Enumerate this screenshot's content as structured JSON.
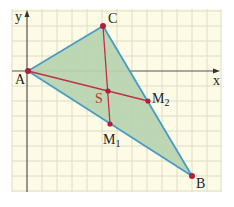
{
  "diagram": {
    "type": "triangle-centroid-on-grid",
    "colors": {
      "grid_bg": "#fdfbe6",
      "grid_line": "#dcdcc4",
      "axis": "#555555",
      "triangle_fill": "#b7d4b0",
      "triangle_edge": "#4a9cc4",
      "median": "#c0304a",
      "point": "#b0203a"
    },
    "axes": {
      "x_label": "x",
      "y_label": "y"
    },
    "points": {
      "A": {
        "label": "A",
        "x": 28,
        "y": 71
      },
      "B": {
        "label": "B",
        "x": 192,
        "y": 176
      },
      "C": {
        "label": "C",
        "x": 103,
        "y": 26
      },
      "M1": {
        "label": "M",
        "sub": "1",
        "x": 110,
        "y": 124
      },
      "M2": {
        "label": "M",
        "sub": "2",
        "x": 148,
        "y": 101
      },
      "S": {
        "label": "S",
        "x": 108,
        "y": 91
      }
    }
  }
}
